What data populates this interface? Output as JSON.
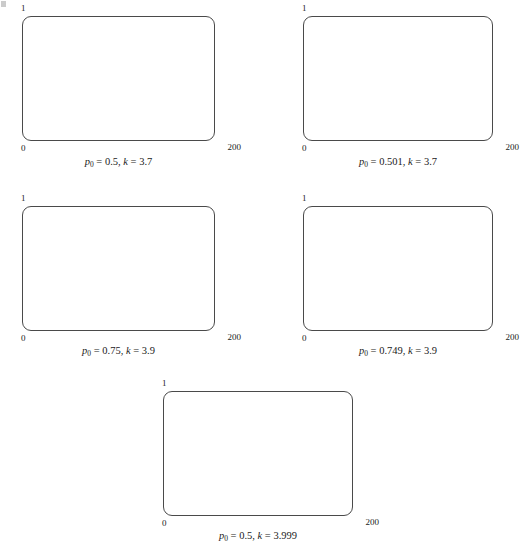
{
  "figure": {
    "title": "",
    "panel_count": 5
  },
  "axis": {
    "y_max_label": "1",
    "y_min_label": "0",
    "x_max_label": "200",
    "x_min_label": "0"
  },
  "panels": [
    {
      "id": "panel-p0-0p5-k-3p7",
      "caption_parts": {
        "p_symbol": "p",
        "p_sub": "0",
        "eq1": " = ",
        "p_value": "0.5",
        "sep": ", ",
        "k_symbol": "k",
        "eq2": " = ",
        "k_value": "3.7"
      },
      "caption_text": "p0 = 0.5, k = 3.7",
      "p0": 0.5,
      "k": 3.7
    },
    {
      "id": "panel-p0-0p501-k-3p7",
      "caption_parts": {
        "p_symbol": "p",
        "p_sub": "0",
        "eq1": " = ",
        "p_value": "0.501",
        "sep": ", ",
        "k_symbol": "k",
        "eq2": " = ",
        "k_value": "3.7"
      },
      "caption_text": "p0 = 0.501, k = 3.7",
      "p0": 0.501,
      "k": 3.7
    },
    {
      "id": "panel-p0-0p75-k-3p9",
      "caption_parts": {
        "p_symbol": "p",
        "p_sub": "0",
        "eq1": " = ",
        "p_value": "0.75",
        "sep": ", ",
        "k_symbol": "k",
        "eq2": " = ",
        "k_value": "3.9"
      },
      "caption_text": "p0 = 0.75, k = 3.9",
      "p0": 0.75,
      "k": 3.9
    },
    {
      "id": "panel-p0-0p749-k-3p9",
      "caption_parts": {
        "p_symbol": "p",
        "p_sub": "0",
        "eq1": " = ",
        "p_value": "0.749",
        "sep": ", ",
        "k_symbol": "k",
        "eq2": " = ",
        "k_value": "3.9"
      },
      "caption_text": "p0 = 0.749, k = 3.9",
      "p0": 0.749,
      "k": 3.9
    },
    {
      "id": "panel-p0-0p5-k-3p999",
      "caption_parts": {
        "p_symbol": "p",
        "p_sub": "0",
        "eq1": " = ",
        "p_value": "0.5",
        "sep": ", ",
        "k_symbol": "k",
        "eq2": " = ",
        "k_value": "3.999"
      },
      "caption_text": "p0 = 0.5, k = 3.999",
      "p0": 0.5,
      "k": 3.999
    }
  ],
  "chart_data": {
    "type": "scatter",
    "title": "",
    "xlabel": "",
    "ylabel": "",
    "xlim": [
      0,
      200
    ],
    "ylim": [
      0,
      1
    ],
    "grid": false,
    "legend": null,
    "marker": {
      "shape": "circle",
      "size_px": 2,
      "color": "#000000"
    },
    "frame": {
      "style": "rounded-rectangle",
      "color": "#4a4a4a",
      "width_px": 1
    },
    "panels": [
      {
        "name": "p0 = 0.5, k = 3.7",
        "p0": 0.5,
        "k": 3.7,
        "n_points": 200,
        "x": [
          1,
          2,
          3,
          4,
          5,
          6,
          7,
          8,
          9,
          10,
          11,
          12,
          13,
          14,
          15,
          16,
          17,
          18,
          19,
          20,
          21,
          22,
          23,
          24,
          25,
          26,
          27,
          28,
          29,
          30,
          31,
          32,
          33,
          34,
          35,
          36,
          37,
          38,
          39,
          40,
          41,
          42,
          43,
          44,
          45,
          46,
          47,
          48,
          49,
          50,
          51,
          52,
          53,
          54,
          55,
          56,
          57,
          58,
          59,
          60,
          61,
          62,
          63,
          64,
          65,
          66,
          67,
          68,
          69,
          70,
          71,
          72,
          73,
          74,
          75,
          76,
          77,
          78,
          79,
          80,
          81,
          82,
          83,
          84,
          85,
          86,
          87,
          88,
          89,
          90,
          91,
          92,
          93,
          94,
          95,
          96,
          97,
          98,
          99,
          100,
          101,
          102,
          103,
          104,
          105,
          106,
          107,
          108,
          109,
          110,
          111,
          112,
          113,
          114,
          115,
          116,
          117,
          118,
          119,
          120,
          121,
          122,
          123,
          124,
          125,
          126,
          127,
          128,
          129,
          130,
          131,
          132,
          133,
          134,
          135,
          136,
          137,
          138,
          139,
          140,
          141,
          142,
          143,
          144,
          145,
          146,
          147,
          148,
          149,
          150,
          151,
          152,
          153,
          154,
          155,
          156,
          157,
          158,
          159,
          160,
          161,
          162,
          163,
          164,
          165,
          166,
          167,
          168,
          169,
          170,
          171,
          172,
          173,
          174,
          175,
          176,
          177,
          178,
          179,
          180,
          181,
          182,
          183,
          184,
          185,
          186,
          187,
          188,
          189,
          190,
          191,
          192,
          193,
          194,
          195,
          196,
          197,
          198,
          199,
          200
        ],
        "y": [
          0.925,
          0.257,
          0.706,
          0.768,
          0.659,
          0.831,
          0.519,
          0.924,
          0.26,
          0.712,
          0.759,
          0.677,
          0.809,
          0.572,
          0.906,
          0.315,
          0.798,
          0.596,
          0.891,
          0.359,
          0.851,
          0.469,
          0.921,
          0.269,
          0.727,
          0.734,
          0.722,
          0.743,
          0.706,
          0.768,
          0.659,
          0.831,
          0.519,
          0.924,
          0.26,
          0.712,
          0.759,
          0.677,
          0.809,
          0.572,
          0.906,
          0.315,
          0.798,
          0.596,
          0.891,
          0.359,
          0.851,
          0.469,
          0.921,
          0.269,
          0.727,
          0.734,
          0.722,
          0.743,
          0.706,
          0.768,
          0.659,
          0.831,
          0.519,
          0.924,
          0.26,
          0.712,
          0.759,
          0.677,
          0.809,
          0.572,
          0.906,
          0.315,
          0.798,
          0.596,
          0.891,
          0.359,
          0.851,
          0.469,
          0.921,
          0.269,
          0.727,
          0.734,
          0.722,
          0.743,
          0.706,
          0.768,
          0.659,
          0.831,
          0.519,
          0.924,
          0.26,
          0.712,
          0.759,
          0.677,
          0.809,
          0.572,
          0.906,
          0.315,
          0.798,
          0.596,
          0.891,
          0.359,
          0.851,
          0.469,
          0.921,
          0.269,
          0.727,
          0.734,
          0.722,
          0.743,
          0.706,
          0.768,
          0.659,
          0.831,
          0.519,
          0.924,
          0.26,
          0.712,
          0.759,
          0.677,
          0.809,
          0.572,
          0.906,
          0.315,
          0.798,
          0.596,
          0.891,
          0.359,
          0.851,
          0.469,
          0.921,
          0.269,
          0.727,
          0.734,
          0.722,
          0.743,
          0.706,
          0.768,
          0.659,
          0.831,
          0.519,
          0.924,
          0.26,
          0.712,
          0.759,
          0.677,
          0.809,
          0.572,
          0.906,
          0.315,
          0.798,
          0.596,
          0.891,
          0.359,
          0.851,
          0.469,
          0.921,
          0.269,
          0.727,
          0.734,
          0.722,
          0.743,
          0.706,
          0.768,
          0.659,
          0.831,
          0.519,
          0.924,
          0.26,
          0.712,
          0.759,
          0.677,
          0.809,
          0.572,
          0.906,
          0.315,
          0.798,
          0.596,
          0.891,
          0.359,
          0.851,
          0.469,
          0.921,
          0.269,
          0.727,
          0.734,
          0.722,
          0.743,
          0.706,
          0.768,
          0.659,
          0.831,
          0.519,
          0.924,
          0.26,
          0.712,
          0.759,
          0.677,
          0.809,
          0.572,
          0.906,
          0.315
        ]
      },
      {
        "name": "p0 = 0.501, k = 3.7",
        "p0": 0.501,
        "k": 3.7,
        "n_points": 200,
        "seed_offset": 0.001
      },
      {
        "name": "p0 = 0.75, k = 3.9",
        "p0": 0.75,
        "k": 3.9,
        "n_points": 200
      },
      {
        "name": "p0 = 0.749, k = 3.9",
        "p0": 0.749,
        "k": 3.9,
        "n_points": 200,
        "seed_offset": -0.001
      },
      {
        "name": "p0 = 0.5, k = 3.999",
        "p0": 0.5,
        "k": 3.999,
        "n_points": 200
      }
    ]
  }
}
